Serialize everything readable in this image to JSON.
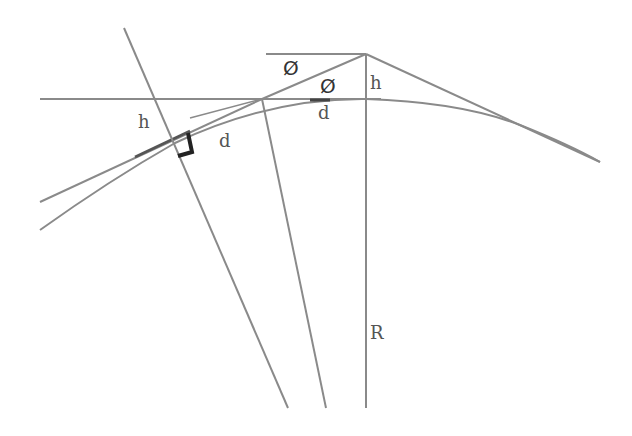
{
  "diagram": {
    "type": "geometry",
    "colors": {
      "line": "#8a8a8a",
      "dark_line": "#555555",
      "marker": "#222222",
      "background": "#ffffff"
    },
    "labels": {
      "phi_top": "Ø",
      "phi_inner": "Ø",
      "h_right": "h",
      "h_left": "h",
      "d_top": "d",
      "d_left": "d",
      "r": "R"
    }
  }
}
